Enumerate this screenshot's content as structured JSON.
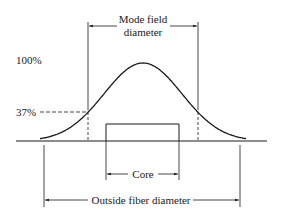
{
  "diagram": {
    "labels": {
      "mode_field_line1": "Mode field",
      "mode_field_line2": "diameter",
      "peak_level": "100%",
      "threshold_level": "37%",
      "core": "Core",
      "outside_fiber": "Outside fiber diameter"
    },
    "values": {
      "peak_percent": 100,
      "threshold_percent": 37
    },
    "colors": {
      "ink": "#1a1a1a",
      "background": "#ffffff"
    }
  }
}
